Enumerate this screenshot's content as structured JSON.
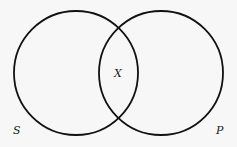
{
  "diagram": {
    "type": "venn",
    "sets": [
      {
        "name": "S",
        "label": "S",
        "cx": 76,
        "cy": 73,
        "r": 62
      },
      {
        "name": "P",
        "label": "P",
        "cx": 161,
        "cy": 73,
        "r": 62
      }
    ],
    "intersection_label": "X",
    "stroke_color": "#111111",
    "background": "#f7f7f7"
  }
}
